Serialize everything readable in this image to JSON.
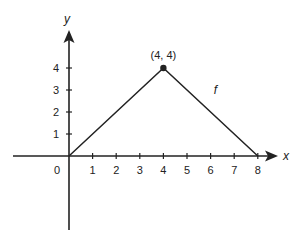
{
  "chart_data": {
    "type": "line",
    "title": "",
    "xlabel": "x",
    "ylabel": "y",
    "xlim": [
      -2.3,
      8.5
    ],
    "ylim": [
      -3.0,
      5.5
    ],
    "grid": false,
    "legend": null,
    "x_ticks": [
      1,
      2,
      3,
      4,
      5,
      6,
      7,
      8
    ],
    "x_tick_labels": [
      "1",
      "2",
      "3",
      "4",
      "5",
      "6",
      "7",
      "8"
    ],
    "y_ticks": [
      1,
      2,
      3,
      4
    ],
    "y_tick_labels": [
      "1",
      "2",
      "3",
      "4"
    ],
    "origin_label": "0",
    "series": [
      {
        "name": "f",
        "x": [
          0,
          4,
          8
        ],
        "y": [
          0,
          4,
          0
        ]
      }
    ],
    "annotations": [
      {
        "text": "(4, 4)",
        "x": 4,
        "y": 4,
        "marker": "filled-dot"
      },
      {
        "text": "f",
        "x": 6.2,
        "y": 3.0
      }
    ],
    "colors": {
      "line": "#222222",
      "axis": "#222222"
    }
  }
}
